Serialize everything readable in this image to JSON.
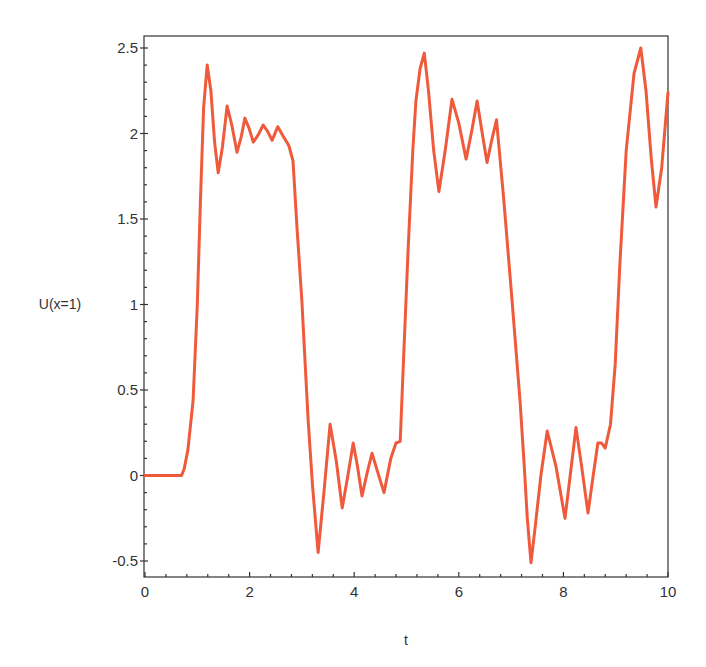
{
  "chart_data": {
    "type": "line",
    "title": "",
    "xlabel": "t",
    "ylabel": "U(x=1)",
    "xlim": [
      0,
      10
    ],
    "ylim": [
      -0.6,
      2.55
    ],
    "grid": false,
    "legend": null,
    "xticks": [
      0,
      2,
      4,
      6,
      8,
      10
    ],
    "xtick_labels": [
      "0",
      "2",
      "4",
      "6",
      "8",
      "10"
    ],
    "yticks": [
      -0.5,
      0,
      0.5,
      1,
      1.5,
      2,
      2.5
    ],
    "ytick_labels": [
      "-0.5",
      "0",
      "0.5",
      "1",
      "1.5",
      "2",
      "2.5"
    ],
    "series": [
      {
        "name": "U(x=1)",
        "color": "#f05a3c",
        "x": [
          0,
          0.5,
          0.7,
          0.75,
          0.82,
          0.92,
          1.0,
          1.06,
          1.12,
          1.19,
          1.26,
          1.33,
          1.4,
          1.48,
          1.57,
          1.66,
          1.76,
          1.84,
          1.91,
          1.99,
          2.07,
          2.16,
          2.26,
          2.35,
          2.43,
          2.54,
          2.65,
          2.75,
          2.83,
          2.91,
          3.0,
          3.06,
          3.12,
          3.2,
          3.31,
          3.42,
          3.54,
          3.66,
          3.77,
          3.88,
          3.98,
          4.06,
          4.15,
          4.25,
          4.34,
          4.45,
          4.57,
          4.7,
          4.8,
          4.88,
          4.95,
          5.03,
          5.12,
          5.18,
          5.26,
          5.34,
          5.42,
          5.52,
          5.62,
          5.74,
          5.87,
          6.0,
          6.14,
          6.25,
          6.35,
          6.45,
          6.54,
          6.63,
          6.72,
          6.86,
          7.02,
          7.17,
          7.25,
          7.31,
          7.38,
          7.46,
          7.57,
          7.69,
          7.86,
          8.03,
          8.13,
          8.24,
          8.35,
          8.47,
          8.57,
          8.66,
          8.73,
          8.8,
          8.9,
          8.99,
          9.08,
          9.2,
          9.35,
          9.48,
          9.58,
          9.68,
          9.77,
          9.88,
          10.0
        ],
        "y": [
          0,
          0,
          0,
          0.04,
          0.15,
          0.44,
          1.0,
          1.6,
          2.15,
          2.4,
          2.25,
          1.95,
          1.77,
          1.92,
          2.16,
          2.05,
          1.89,
          1.98,
          2.09,
          2.03,
          1.95,
          1.99,
          2.05,
          2.01,
          1.96,
          2.04,
          1.98,
          1.93,
          1.84,
          1.43,
          1.02,
          0.67,
          0.32,
          -0.05,
          -0.45,
          -0.1,
          0.3,
          0.08,
          -0.19,
          0.0,
          0.19,
          0.06,
          -0.12,
          0.02,
          0.13,
          0.02,
          -0.1,
          0.1,
          0.19,
          0.2,
          0.73,
          1.32,
          1.9,
          2.19,
          2.38,
          2.47,
          2.25,
          1.9,
          1.66,
          1.9,
          2.2,
          2.06,
          1.85,
          2.02,
          2.19,
          2.0,
          1.83,
          1.96,
          2.08,
          1.61,
          1.02,
          0.44,
          0.06,
          -0.25,
          -0.51,
          -0.3,
          0.0,
          0.26,
          0.05,
          -0.25,
          0.0,
          0.28,
          0.05,
          -0.22,
          0.0,
          0.19,
          0.19,
          0.16,
          0.3,
          0.65,
          1.24,
          1.9,
          2.35,
          2.5,
          2.25,
          1.85,
          1.57,
          1.8,
          2.24
        ]
      }
    ]
  }
}
